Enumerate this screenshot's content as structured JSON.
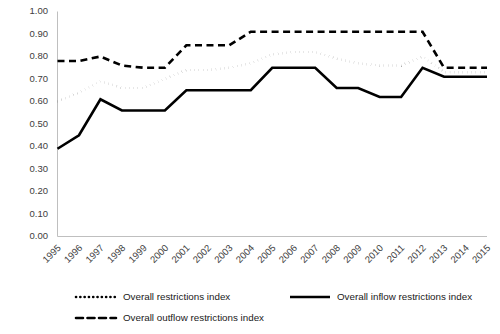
{
  "chart_data": {
    "type": "line",
    "title": "",
    "xlabel": "",
    "ylabel": "",
    "ylim": [
      0.0,
      1.0
    ],
    "ytick_step": 0.1,
    "grid": false,
    "legend_position": "bottom",
    "x": [
      1995,
      1996,
      1997,
      1998,
      1999,
      2000,
      2001,
      2002,
      2003,
      2004,
      2005,
      2006,
      2007,
      2008,
      2009,
      2010,
      2011,
      2012,
      2013,
      2014,
      2015
    ],
    "categories": [
      "1995",
      "1996",
      "1997",
      "1998",
      "1999",
      "2000",
      "2001",
      "2002",
      "2003",
      "2004",
      "2005",
      "2006",
      "2007",
      "2008",
      "2009",
      "2010",
      "2011",
      "2012",
      "2013",
      "2014",
      "2015"
    ],
    "ytick_labels": [
      "0.00",
      "0.10",
      "0.20",
      "0.30",
      "0.40",
      "0.50",
      "0.60",
      "0.70",
      "0.80",
      "0.90",
      "1.00"
    ],
    "ytick_values": [
      0.0,
      0.1,
      0.2,
      0.3,
      0.4,
      0.5,
      0.6,
      0.7,
      0.8,
      0.9,
      1.0
    ],
    "series": [
      {
        "name": "Overall restrictions index",
        "style": "dotted",
        "values": [
          0.6,
          0.64,
          0.69,
          0.66,
          0.66,
          0.7,
          0.74,
          0.74,
          0.75,
          0.77,
          0.81,
          0.82,
          0.82,
          0.79,
          0.77,
          0.76,
          0.76,
          0.8,
          0.73,
          0.73,
          0.73
        ]
      },
      {
        "name": "Overall inflow restrictions index",
        "style": "solid",
        "values": [
          0.39,
          0.45,
          0.61,
          0.56,
          0.56,
          0.56,
          0.65,
          0.65,
          0.65,
          0.65,
          0.75,
          0.75,
          0.75,
          0.66,
          0.66,
          0.62,
          0.62,
          0.75,
          0.71,
          0.71,
          0.71
        ]
      },
      {
        "name": "Overall outflow restrictions index",
        "style": "dashed",
        "values": [
          0.78,
          0.78,
          0.8,
          0.76,
          0.75,
          0.75,
          0.85,
          0.85,
          0.85,
          0.91,
          0.91,
          0.91,
          0.91,
          0.91,
          0.91,
          0.91,
          0.91,
          0.91,
          0.75,
          0.75,
          0.75
        ]
      }
    ]
  },
  "legend": {
    "items": [
      {
        "label": "Overall restrictions index",
        "style": "dotted"
      },
      {
        "label": "Overall inflow restrictions index",
        "style": "solid"
      },
      {
        "label": "Overall outflow restrictions index",
        "style": "dashed"
      }
    ]
  }
}
